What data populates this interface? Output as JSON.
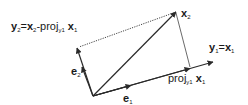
{
  "diagram": {
    "type": "vector-projection (Gram-Schmidt)",
    "colors": {
      "line": "#2a2a2a",
      "text": "#1a1a1a",
      "background": "#ffffff"
    },
    "vectors": [
      {
        "id": "x1",
        "from": [
          93,
          96
        ],
        "to": [
          213,
          62
        ],
        "style": "solid",
        "arrow": true
      },
      {
        "id": "x2",
        "from": [
          93,
          96
        ],
        "to": [
          176,
          12
        ],
        "style": "solid",
        "arrow": true
      },
      {
        "id": "y2",
        "from": [
          93,
          96
        ],
        "to": [
          77,
          49
        ],
        "style": "solid",
        "arrow": true
      },
      {
        "id": "proj",
        "from": [
          93,
          96
        ],
        "to": [
          190,
          68
        ],
        "style": "solid",
        "arrow": true
      },
      {
        "id": "e1",
        "from": [
          93,
          96
        ],
        "to": [
          130,
          86
        ],
        "style": "solid",
        "arrow": true
      },
      {
        "id": "e2",
        "from": [
          93,
          96
        ],
        "to": [
          82,
          68
        ],
        "style": "solid",
        "arrow": true
      }
    ],
    "guides": [
      {
        "id": "x2-to-y2",
        "from": [
          176,
          12
        ],
        "to": [
          78,
          48
        ],
        "style": "dotted"
      },
      {
        "id": "x2-to-proj",
        "from": [
          176,
          12
        ],
        "to": [
          190,
          68
        ],
        "style": "thin"
      }
    ],
    "labels": {
      "y2": {
        "prefix": "y",
        "sub": "2",
        "eq": "=",
        "x": "x",
        "xsub": "2",
        "minus_proj": "-proj",
        "proj_sub": "y",
        "proj_sub2": "1",
        "tail": "x",
        "tail_sub": "1"
      },
      "x2": {
        "main": "x",
        "sub": "2"
      },
      "y1": {
        "main": "y",
        "sub": "1",
        "eq": "=",
        "x": "x",
        "xsub": "1"
      },
      "proj": {
        "main": "proj",
        "sub": "y",
        "sub2": "1",
        "x": "x",
        "xsub": "1"
      },
      "e1": {
        "main": "e",
        "sub": "1"
      },
      "e2": {
        "main": "e",
        "sub": "2"
      }
    }
  }
}
